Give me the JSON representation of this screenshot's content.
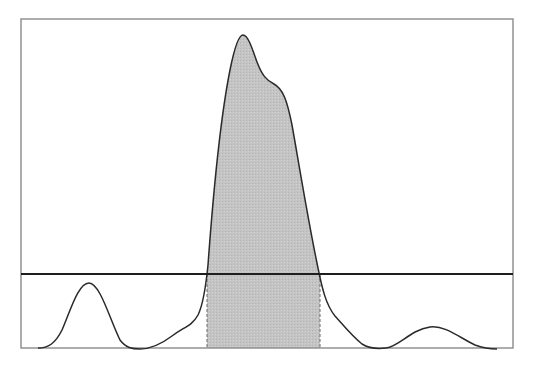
{
  "chart_data": {
    "type": "area",
    "title": "",
    "xlabel": "",
    "ylabel": "",
    "grid": false,
    "legend": null,
    "frame": {
      "x0": 21,
      "y0": 19,
      "x1": 513,
      "y1": 348
    },
    "threshold_y": 274,
    "shaded_interval": {
      "x_start": 207,
      "x_end": 320
    },
    "peaks": [
      {
        "name": "left-minor-peak",
        "x": 89,
        "y": 283
      },
      {
        "name": "main-peak",
        "x": 242,
        "y": 35
      },
      {
        "name": "main-peak-shoulder",
        "x": 276,
        "y": 82
      },
      {
        "name": "right-minor-peak",
        "x": 430,
        "y": 327
      }
    ],
    "curve_path": "M38,348 C48,348 55,344 62,330 C70,312 78,283 89,283 C100,283 110,320 120,340 C126,348 132,349 140,349 C150,349 160,345 172,336 C184,327 192,326 198,315 C203,305 206,285 208,265 C212,210 220,120 230,70 C235,45 239,35 243,35 C248,35 252,48 257,62 C262,75 266,80 274,84 C283,89 287,100 292,125 C300,170 308,220 318,268 C322,288 326,305 335,316 C344,326 352,336 362,344 C370,349 378,349 386,348 C400,346 410,330 430,327 C445,325 460,338 475,345 C483,348 490,349 497,349",
    "colors": {
      "curve": "#2a2a2a",
      "fill": "#c2c2c2",
      "frame": "#8a8a8a",
      "threshold": "#1e1e1e",
      "dashed_bound": "#6a6a6a"
    }
  }
}
